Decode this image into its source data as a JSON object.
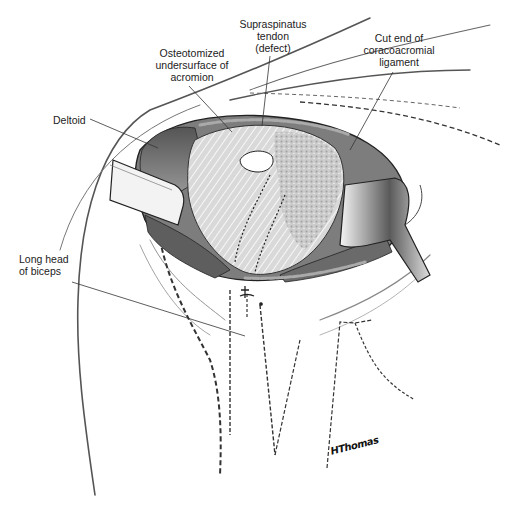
{
  "figure": {
    "labels": [
      {
        "id": "supraspinatus",
        "lines": [
          "Supraspinatus",
          "tendon",
          "(defect)"
        ]
      },
      {
        "id": "acromion",
        "lines": [
          "Osteotomized",
          "undersurface of",
          "acromion"
        ]
      },
      {
        "id": "coracoacromial",
        "lines": [
          "Cut end of",
          "coracoacromial",
          "ligament"
        ]
      },
      {
        "id": "deltoid",
        "lines": [
          "Deltoid"
        ]
      },
      {
        "id": "biceps",
        "lines": [
          "Long head",
          "of biceps"
        ]
      }
    ],
    "signature": "HThomas"
  },
  "colors": {
    "ink": "#222222",
    "tissue_dark": "#4a4a4a",
    "tissue_mid": "#9a9a9a",
    "tissue_light": "#d8d8d8",
    "retractor": "#eeeeee",
    "background": "#ffffff"
  }
}
